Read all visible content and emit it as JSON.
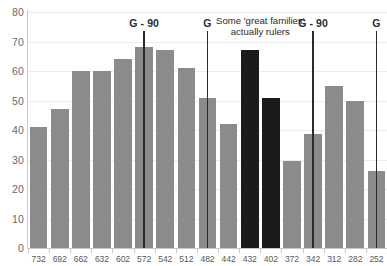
{
  "chart_data": {
    "type": "bar",
    "title": "",
    "subtitle": "",
    "xlabel": "",
    "ylabel": "",
    "ylim": [
      0,
      80
    ],
    "ytick_step": 10,
    "yticks": [
      "0",
      "10",
      "20",
      "30",
      "40",
      "50",
      "60",
      "70",
      "80"
    ],
    "grid": true,
    "legend": null,
    "categories": [
      "732",
      "692",
      "662",
      "632",
      "602",
      "572",
      "542",
      "512",
      "482",
      "442",
      "432",
      "402",
      "372",
      "342",
      "312",
      "282",
      "252"
    ],
    "values": [
      41,
      47,
      60,
      60,
      64,
      68,
      67,
      61,
      51,
      42,
      67,
      51,
      29.5,
      38.5,
      55,
      50,
      26
    ],
    "bar_colors": [
      "gray",
      "gray",
      "gray",
      "gray",
      "gray",
      "gray",
      "gray",
      "gray",
      "gray",
      "gray",
      "dark",
      "dark",
      "gray",
      "gray",
      "gray",
      "gray",
      "gray"
    ],
    "colors": {
      "gray": "#8b8b8d",
      "dark": "#1b1b1b",
      "grid": "#ededed",
      "axis": "#c9c9c9",
      "text": "#58585a",
      "marker": "#2b2b2b"
    },
    "annotations": [
      {
        "name": "marker-g-90-first",
        "label": "G - 90",
        "category_index": 5
      },
      {
        "name": "marker-g-second",
        "label": "G",
        "category_index": 8
      },
      {
        "name": "marker-g-90-third",
        "label": "G - 90",
        "category_index": 13
      },
      {
        "name": "marker-g-fourth",
        "label": "G",
        "category_index": 16
      }
    ],
    "note": {
      "line1": "Some 'great families'",
      "line2": "actually rulers"
    }
  }
}
